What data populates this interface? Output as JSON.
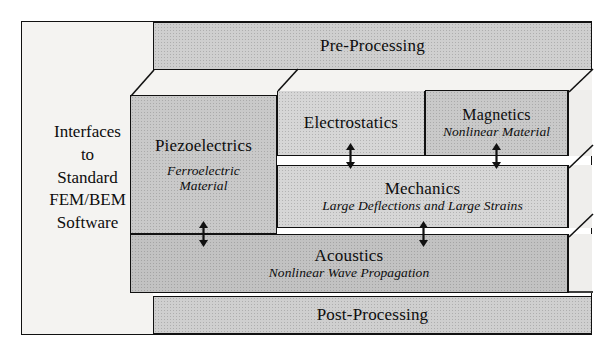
{
  "diagram": {
    "title_blocks": {
      "pre_processing": "Pre-Processing",
      "post_processing": "Post-Processing"
    },
    "interfaces_panel": {
      "lines": [
        "Interfaces",
        "to",
        "Standard",
        "FEM/BEM",
        "Software"
      ],
      "text": "Interfaces\nto\nStandard\nFEM/BEM\nSoftware"
    },
    "modules": [
      {
        "id": "piezoelectrics",
        "title": "Piezoelectrics",
        "subtitle": "Ferroelectric Material",
        "subtitle_line1": "Ferroelectric",
        "subtitle_line2": "Material"
      },
      {
        "id": "electrostatics",
        "title": "Electrostatics",
        "subtitle": ""
      },
      {
        "id": "magnetics",
        "title": "Magnetics",
        "subtitle": "Nonlinear Material"
      },
      {
        "id": "mechanics",
        "title": "Mechanics",
        "subtitle": "Large Deflections and Large Strains"
      },
      {
        "id": "acoustics",
        "title": "Acoustics",
        "subtitle": "Nonlinear Wave Propagation"
      }
    ],
    "couplings": [
      {
        "id": "piezoelectrics-acoustics",
        "symbol": "↕"
      },
      {
        "id": "electrostatics-mechanics",
        "symbol": "↕"
      },
      {
        "id": "magnetics-mechanics",
        "symbol": "↕"
      },
      {
        "id": "mechanics-acoustics",
        "symbol": "↕"
      }
    ],
    "colors": {
      "outline": "#111111",
      "block_fill": "#c9c9c9",
      "block_fill_light": "#d6d6d6",
      "panel_fill": "#f4f3f1",
      "depth_face_fill": "#efeeec",
      "text": "#0d0d0d"
    }
  }
}
